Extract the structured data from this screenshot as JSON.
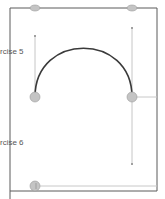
{
  "labels": {
    "exercise5": "rcise 5",
    "exercise6": "rcise 6"
  },
  "colors": {
    "frame": "#5a5a5a",
    "path": "#3a3a3a",
    "handle": "#b8b8b8",
    "anchor_fill": "#c4c4c4",
    "anchor_stroke": "#9a9a9a"
  },
  "anchors": [
    {
      "name": "top-left-anchor",
      "x": 35,
      "y": 8
    },
    {
      "name": "top-right-anchor",
      "x": 132,
      "y": 8
    },
    {
      "name": "arc-start-anchor",
      "x": 35,
      "y": 97
    },
    {
      "name": "arc-end-anchor",
      "x": 132,
      "y": 97
    },
    {
      "name": "bottom-anchor",
      "x": 35,
      "y": 186
    }
  ]
}
